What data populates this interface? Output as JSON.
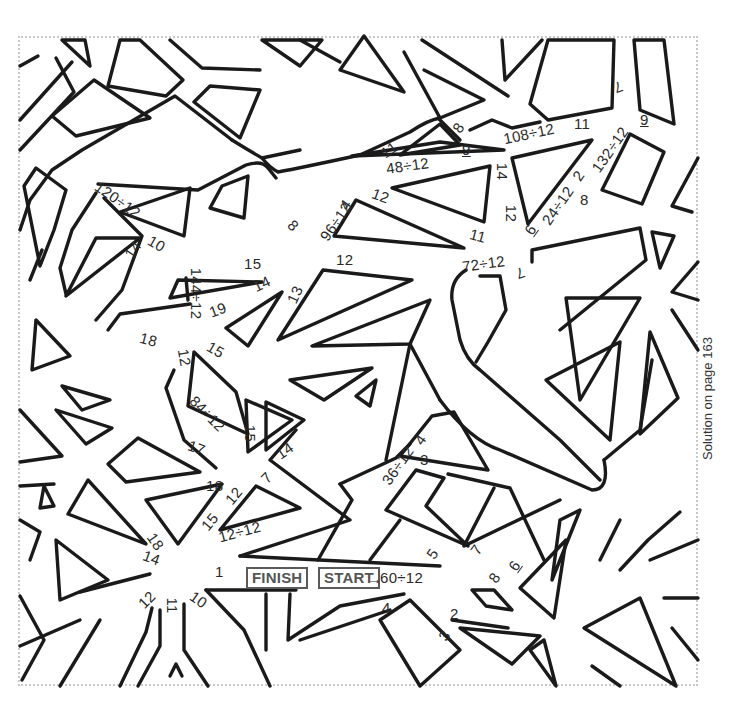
{
  "puzzle": {
    "type": "division maze",
    "top_caption": "",
    "start_label": "START",
    "finish_label": "FINISH",
    "start_arrow": "→",
    "start_expression": "60÷12",
    "solution_note": "Solution on page 163"
  },
  "labels": [
    {
      "text": "120÷12",
      "x": 96,
      "y": 200,
      "rot": 35
    },
    {
      "text": "14",
      "x": 128,
      "y": 250,
      "rot": -55
    },
    {
      "text": "10",
      "x": 152,
      "y": 244,
      "rot": 30
    },
    {
      "text": "8",
      "x": 293,
      "y": 226,
      "rot": 45
    },
    {
      "text": "96÷12",
      "x": 318,
      "y": 222,
      "rot": -55
    },
    {
      "text": "4",
      "x": 345,
      "y": 205,
      "rot": -55
    },
    {
      "text": "11",
      "x": 385,
      "y": 150,
      "rot": -35
    },
    {
      "text": "48÷12",
      "x": 390,
      "y": 166,
      "rot": -8
    },
    {
      "text": "8",
      "x": 458,
      "y": 128,
      "rot": -55
    },
    {
      "text": "9",
      "x": 466,
      "y": 150,
      "rot": 0,
      "underline": true
    },
    {
      "text": "12",
      "x": 376,
      "y": 196,
      "rot": 20
    },
    {
      "text": "108÷12",
      "x": 507,
      "y": 134,
      "rot": -12
    },
    {
      "text": "11",
      "x": 578,
      "y": 124,
      "rot": 0
    },
    {
      "text": "7",
      "x": 618,
      "y": 88,
      "rot": 160
    },
    {
      "text": "132÷12",
      "x": 588,
      "y": 150,
      "rot": -55
    },
    {
      "text": "9",
      "x": 644,
      "y": 120,
      "rot": 0,
      "underline": true
    },
    {
      "text": "2",
      "x": 578,
      "y": 176,
      "rot": -55
    },
    {
      "text": "8",
      "x": 584,
      "y": 200,
      "rot": 0
    },
    {
      "text": "14",
      "x": 498,
      "y": 172,
      "rot": 90
    },
    {
      "text": "12",
      "x": 507,
      "y": 214,
      "rot": 90
    },
    {
      "text": "6",
      "x": 530,
      "y": 230,
      "rot": -55,
      "underline": true
    },
    {
      "text": "24÷12",
      "x": 540,
      "y": 206,
      "rot": -55
    },
    {
      "text": "11",
      "x": 474,
      "y": 236,
      "rot": 15
    },
    {
      "text": "12",
      "x": 340,
      "y": 260,
      "rot": 0
    },
    {
      "text": "72÷12",
      "x": 466,
      "y": 264,
      "rot": -8
    },
    {
      "text": "7",
      "x": 520,
      "y": 274,
      "rot": 160
    },
    {
      "text": "15",
      "x": 248,
      "y": 264,
      "rot": 0
    },
    {
      "text": "144÷12",
      "x": 175,
      "y": 294,
      "rot": 90
    },
    {
      "text": "19",
      "x": 213,
      "y": 310,
      "rot": -20
    },
    {
      "text": "14",
      "x": 257,
      "y": 284,
      "rot": -25
    },
    {
      "text": "13",
      "x": 290,
      "y": 295,
      "rot": -65
    },
    {
      "text": "18",
      "x": 144,
      "y": 340,
      "rot": 15
    },
    {
      "text": "12",
      "x": 180,
      "y": 358,
      "rot": 80
    },
    {
      "text": "15",
      "x": 211,
      "y": 350,
      "rot": 30
    },
    {
      "text": "84÷12",
      "x": 190,
      "y": 414,
      "rot": 45
    },
    {
      "text": "15",
      "x": 246,
      "y": 434,
      "rot": 90
    },
    {
      "text": "17",
      "x": 192,
      "y": 448,
      "rot": 20
    },
    {
      "text": "14",
      "x": 280,
      "y": 451,
      "rot": -35
    },
    {
      "text": "7",
      "x": 266,
      "y": 478,
      "rot": -45
    },
    {
      "text": "18",
      "x": 210,
      "y": 486,
      "rot": 0
    },
    {
      "text": "12",
      "x": 229,
      "y": 496,
      "rot": -50
    },
    {
      "text": "15",
      "x": 205,
      "y": 522,
      "rot": -50
    },
    {
      "text": "12÷12",
      "x": 222,
      "y": 532,
      "rot": -15
    },
    {
      "text": "18",
      "x": 151,
      "y": 542,
      "rot": 55
    },
    {
      "text": "14",
      "x": 147,
      "y": 558,
      "rot": 20
    },
    {
      "text": "1",
      "x": 219,
      "y": 572,
      "rot": 0
    },
    {
      "text": "12",
      "x": 142,
      "y": 600,
      "rot": -45
    },
    {
      "text": "11",
      "x": 168,
      "y": 606,
      "rot": 90
    },
    {
      "text": "10",
      "x": 194,
      "y": 600,
      "rot": 35
    },
    {
      "text": "36÷12",
      "x": 380,
      "y": 466,
      "rot": -55
    },
    {
      "text": "4",
      "x": 420,
      "y": 440,
      "rot": -55
    },
    {
      "text": "3",
      "x": 424,
      "y": 460,
      "rot": 0
    },
    {
      "text": "5",
      "x": 432,
      "y": 554,
      "rot": -55
    },
    {
      "text": "7",
      "x": 476,
      "y": 550,
      "rot": -55
    },
    {
      "text": "6",
      "x": 514,
      "y": 566,
      "rot": -55,
      "underline": true
    },
    {
      "text": "8",
      "x": 494,
      "y": 578,
      "rot": -55
    },
    {
      "text": "2",
      "x": 454,
      "y": 614,
      "rot": 0
    },
    {
      "text": "4",
      "x": 386,
      "y": 608,
      "rot": 0
    },
    {
      "text": "3",
      "x": 444,
      "y": 636,
      "rot": -55
    }
  ]
}
